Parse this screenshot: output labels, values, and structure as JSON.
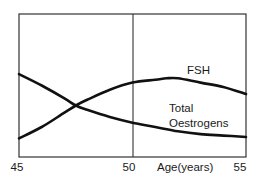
{
  "chart_data": {
    "type": "line",
    "title": "",
    "xlabel": "Age(years)",
    "ylabel": "",
    "xlim": [
      45,
      55
    ],
    "ylim": [
      0,
      100
    ],
    "x_ticks": [
      45,
      50,
      55
    ],
    "x_tick_labels": [
      "45",
      "50",
      "55"
    ],
    "grid": false,
    "reference_line_x": 50,
    "legend": "inline labels",
    "series": [
      {
        "name": "FSH",
        "label": "FSH",
        "x": [
          45,
          46,
          47,
          47.5,
          48,
          49,
          50,
          51,
          51.5,
          52,
          53,
          54,
          55
        ],
        "values": [
          13,
          21,
          31,
          36,
          40,
          47,
          52,
          54,
          55,
          55,
          52,
          49,
          44
        ]
      },
      {
        "name": "Total Oestrogens",
        "label_line1": "Total",
        "label_line2": "Oestrogens",
        "x": [
          45,
          46,
          47,
          47.5,
          48,
          49,
          50,
          51,
          52,
          53,
          54,
          55
        ],
        "values": [
          58,
          50,
          41,
          36,
          33,
          28,
          24,
          21,
          18,
          16,
          15,
          14
        ]
      }
    ]
  },
  "labels": {
    "x_tick_45": "45",
    "x_tick_50": "50",
    "x_tick_55": "55",
    "x_axis_title": "Age(years)",
    "fsh": "FSH",
    "oestrogen_line1": "Total",
    "oestrogen_line2": "Oestrogens"
  },
  "colors": {
    "line": "#111111",
    "frame": "#333333",
    "background": "#ffffff"
  }
}
